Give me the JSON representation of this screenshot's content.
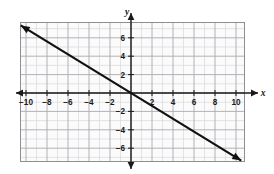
{
  "figure": {
    "kind": "coordinate-plane-line-graph",
    "background_color": "#ffffff",
    "plot_area": {
      "left": 20.5,
      "top": 22.5,
      "right": 244.5,
      "bottom": 161.5
    },
    "border_color": "#8e8e93",
    "grid": {
      "minor_color": "#d8d8dc",
      "major_color": "#a9a9b0",
      "minor_step": 1,
      "major_step": 2,
      "x_min": -11,
      "x_max": 11,
      "y_min": -7.5,
      "y_max": 7.5
    },
    "axes": {
      "color": "#1a1a1a",
      "origin_px": {
        "x": 131,
        "y": 93
      },
      "px_per_unit_x": 10.5,
      "px_per_unit_y": 9.2,
      "x_axis_label": "x",
      "y_axis_label": "y",
      "x_tick_labels": [
        "-10",
        "-8",
        "-6",
        "-4",
        "-2",
        "2",
        "4",
        "6",
        "8",
        "10"
      ],
      "x_tick_values": [
        -10,
        -8,
        -6,
        -4,
        -2,
        2,
        4,
        6,
        8,
        10
      ],
      "y_tick_labels": [
        "6",
        "4",
        "2",
        "-2",
        "-4",
        "-6"
      ],
      "y_tick_values": [
        6,
        4,
        2,
        -2,
        -4,
        -6
      ]
    }
  },
  "chart_data": {
    "type": "line",
    "title": "",
    "xlabel": "x",
    "ylabel": "y",
    "xlim": [
      -11,
      11
    ],
    "ylim": [
      -7.5,
      7.5
    ],
    "grid": true,
    "legend": "none",
    "xticks": [
      -10,
      -8,
      -6,
      -4,
      -2,
      2,
      4,
      6,
      8,
      10
    ],
    "yticks": [
      6,
      4,
      2,
      -2,
      -4,
      -6
    ],
    "series": [
      {
        "name": "line",
        "color": "#111111",
        "slope": -0.7,
        "intercept": 0,
        "arrows": "both",
        "x": [
          -10.5,
          10.5
        ],
        "y": [
          7.35,
          -7.35
        ],
        "points": [
          {
            "x": -10,
            "y": 7
          },
          {
            "x": -5,
            "y": 3.5
          },
          {
            "x": 0,
            "y": 0
          },
          {
            "x": 5,
            "y": -3.5
          },
          {
            "x": 10,
            "y": -7
          }
        ]
      }
    ]
  }
}
